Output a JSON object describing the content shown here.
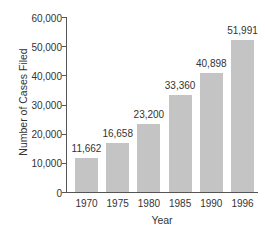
{
  "chart_data": {
    "type": "bar",
    "title": "",
    "xlabel": "Year",
    "ylabel": "Number of Cases Filed",
    "categories": [
      "1970",
      "1975",
      "1980",
      "1985",
      "1990",
      "1996"
    ],
    "values": [
      11662,
      16658,
      23200,
      33360,
      40898,
      51991
    ],
    "value_labels": [
      "11,662",
      "16,658",
      "23,200",
      "33,360",
      "40,898",
      "51,991"
    ],
    "ylim": [
      0,
      60000
    ],
    "yticks": [
      0,
      10000,
      20000,
      30000,
      40000,
      50000,
      60000
    ],
    "ytick_labels": [
      "0",
      "10,000",
      "20,000",
      "30,000",
      "40,000",
      "50,000",
      "60,000"
    ],
    "grid": false,
    "legend": null,
    "bar_color": "#c4c4c4",
    "axis_color": "#555555"
  }
}
